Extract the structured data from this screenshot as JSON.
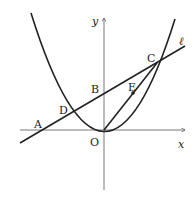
{
  "diagram": {
    "type": "coordinate-geometry",
    "axes": {
      "x_label": "x",
      "y_label": "y",
      "origin_label": "O"
    },
    "line_label": "ℓ",
    "points": {
      "A": "A",
      "B": "B",
      "C": "C",
      "D": "D",
      "E": "E",
      "O": "O"
    },
    "colors": {
      "stroke": "#222222",
      "background": "#ffffff"
    }
  }
}
